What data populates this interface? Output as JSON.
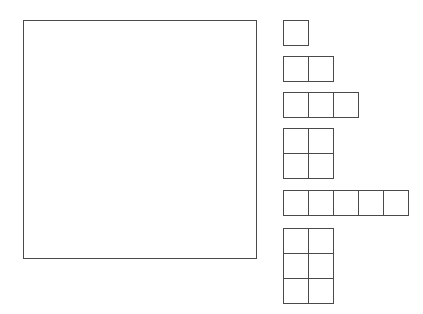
{
  "canvas": {
    "width": 423,
    "height": 314,
    "background_color": "#ffffff",
    "stroke_color": "#4a4a4a",
    "stroke_width": 1
  },
  "target_square": {
    "label": "empty square region",
    "x": 23,
    "y": 20,
    "width": 234,
    "height": 239
  },
  "grid": {
    "cell_size": 25
  },
  "pieces": [
    {
      "name": "piece-1x1",
      "label": "single square",
      "rows": 1,
      "cols": 1,
      "cell_count": 1,
      "x": 283,
      "y": 20,
      "width": 25,
      "height": 25
    },
    {
      "name": "piece-1x2",
      "label": "domino horizontal",
      "rows": 1,
      "cols": 2,
      "cell_count": 2,
      "x": 283,
      "y": 56,
      "width": 50,
      "height": 25
    },
    {
      "name": "piece-1x3",
      "label": "tromino horizontal",
      "rows": 1,
      "cols": 3,
      "cell_count": 3,
      "x": 283,
      "y": 92,
      "width": 75,
      "height": 25
    },
    {
      "name": "piece-2x2",
      "label": "square tetromino",
      "rows": 2,
      "cols": 2,
      "cell_count": 4,
      "x": 283,
      "y": 128,
      "width": 50,
      "height": 50
    },
    {
      "name": "piece-1x5",
      "label": "pentomino horizontal bar",
      "rows": 1,
      "cols": 5,
      "cell_count": 5,
      "x": 283,
      "y": 190,
      "width": 125,
      "height": 25
    },
    {
      "name": "piece-3x2",
      "label": "rectangle three by two",
      "rows": 3,
      "cols": 2,
      "cell_count": 6,
      "x": 283,
      "y": 228,
      "width": 50,
      "height": 75
    }
  ]
}
